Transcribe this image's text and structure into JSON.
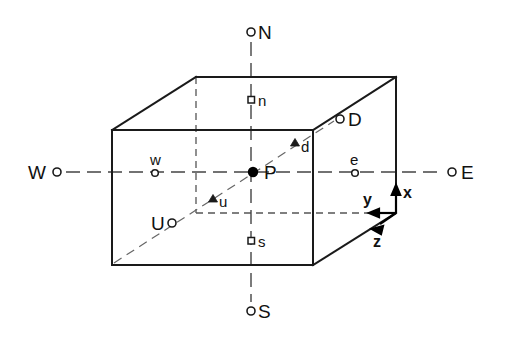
{
  "figure": {
    "type": "line-diagram",
    "background_color": "#ffffff",
    "line_color": "#1a1a1a",
    "dash_color": "#555555"
  },
  "cube": {
    "name": "grid-cell-box",
    "front_top_left": [
      112,
      130
    ],
    "front_top_right": [
      313,
      130
    ],
    "front_bottom_left": [
      112,
      265
    ],
    "front_bottom_right": [
      313,
      265
    ],
    "back_top_left": [
      196,
      77
    ],
    "back_top_right": [
      396,
      77
    ],
    "back_bottom_right": [
      396,
      213
    ]
  },
  "center_point": {
    "label": "P",
    "marker": "filled-dot",
    "x": 253,
    "y": 172
  },
  "cardinal_points": [
    {
      "id": "north",
      "label": "N",
      "marker": "open-circle",
      "cx": 251,
      "cy": 32,
      "tx": 258,
      "ty": 39,
      "size": "major"
    },
    {
      "id": "south",
      "label": "S",
      "marker": "open-circle",
      "cx": 251,
      "cy": 311,
      "tx": 258,
      "ty": 318,
      "size": "major"
    },
    {
      "id": "west",
      "label": "W",
      "marker": "open-circle",
      "cx": 57,
      "cy": 172,
      "tx": 28,
      "ty": 179,
      "size": "major"
    },
    {
      "id": "east",
      "label": "E",
      "marker": "open-circle",
      "cx": 452,
      "cy": 172,
      "tx": 461,
      "ty": 179,
      "size": "major"
    },
    {
      "id": "up",
      "label": "U",
      "marker": "open-circle",
      "cx": 172,
      "cy": 223,
      "tx": 151,
      "ty": 230,
      "size": "major"
    },
    {
      "id": "down",
      "label": "D",
      "marker": "open-circle",
      "cx": 340,
      "cy": 119,
      "tx": 348,
      "ty": 126,
      "size": "major"
    }
  ],
  "face_points": [
    {
      "id": "north-face",
      "label": "n",
      "marker": "open-square",
      "cx": 251,
      "cy": 100,
      "tx": 258,
      "ty": 106,
      "size": "minor"
    },
    {
      "id": "south-face",
      "label": "s",
      "marker": "open-square",
      "cx": 251,
      "cy": 241,
      "tx": 258,
      "ty": 247,
      "size": "minor"
    },
    {
      "id": "west-face",
      "label": "w",
      "marker": "open-circle-small",
      "cx": 155,
      "cy": 173,
      "tx": 150,
      "ty": 164,
      "size": "minor"
    },
    {
      "id": "east-face",
      "label": "e",
      "marker": "open-circle-small",
      "cx": 355,
      "cy": 173,
      "tx": 350,
      "ty": 164,
      "size": "minor"
    },
    {
      "id": "up-face",
      "label": "u",
      "marker": "filled-triangle",
      "cx": 213,
      "cy": 199,
      "tx": 219,
      "ty": 206,
      "size": "minor"
    },
    {
      "id": "down-face",
      "label": "d",
      "marker": "filled-triangle",
      "cx": 295,
      "cy": 143,
      "tx": 301,
      "ty": 151,
      "size": "minor"
    }
  ],
  "axes": {
    "origin": [
      396,
      213
    ],
    "items": [
      {
        "id": "x-axis",
        "label": "x",
        "direction": "up",
        "tip": [
          396,
          188
        ],
        "tx": 403,
        "ty": 198
      },
      {
        "id": "y-axis",
        "label": "y",
        "direction": "left",
        "tip": [
          370,
          213
        ],
        "tx": 364,
        "ty": 204
      },
      {
        "id": "z-axis",
        "label": "z",
        "direction": "down-left",
        "tip": [
          373,
          227
        ],
        "tx": 374,
        "ty": 245
      }
    ]
  },
  "dashed_lines": [
    {
      "id": "ns-axis-line",
      "from": [
        251,
        42
      ],
      "to": [
        251,
        302
      ]
    },
    {
      "id": "we-axis-line",
      "from": [
        66,
        172
      ],
      "to": [
        444,
        172
      ]
    },
    {
      "id": "ud-axis-line",
      "from": [
        178,
        219
      ],
      "to": [
        334,
        121
      ]
    },
    {
      "id": "vertical-back-edge",
      "from": [
        196,
        77
      ],
      "to": [
        196,
        213
      ]
    },
    {
      "id": "horizontal-back-edge",
      "from": [
        196,
        213
      ],
      "to": [
        396,
        213
      ]
    }
  ]
}
